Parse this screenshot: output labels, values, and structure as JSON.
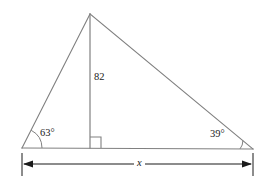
{
  "figure": {
    "type": "triangle-with-altitude",
    "background_color": "#ffffff",
    "stroke_color": "#808080",
    "text_color": "#1a1a1a",
    "labels": {
      "angle_left": "63°",
      "angle_right": "39°",
      "height": "82",
      "base": "x"
    },
    "geometry": {
      "apex": [
        90,
        14
      ],
      "left_vertex": [
        22,
        148
      ],
      "right_vertex": [
        253,
        149
      ],
      "altitude_foot": [
        90,
        148
      ],
      "dimension_line_y": 164,
      "right_angle_box_size": 11,
      "arc_radius_left": 20,
      "arc_radius_right": 13
    }
  }
}
